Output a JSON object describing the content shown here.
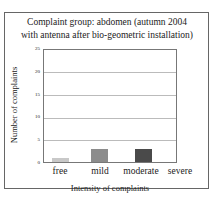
{
  "chart_data": {
    "type": "bar",
    "title": "Complaint group: abdomen (autumn 2004 with antenna after bio-geometric installation)",
    "title_lines": [
      "Complaint group: abdomen (autumn 2004",
      "with antenna after bio-geometric installation)"
    ],
    "categories": [
      "free",
      "mild",
      "moderate",
      "severe"
    ],
    "values": [
      1,
      3,
      3,
      0
    ],
    "colors": [
      "#c8c8c8",
      "#8c8c8c",
      "#4a4a4a",
      "#ffffff"
    ],
    "xlabel": "Intensity of complaints",
    "ylabel": "Number of complaints",
    "ylim": [
      0,
      25
    ],
    "yticks": [
      "0",
      "5",
      "10",
      "15",
      "20",
      "25"
    ],
    "grid": true
  }
}
